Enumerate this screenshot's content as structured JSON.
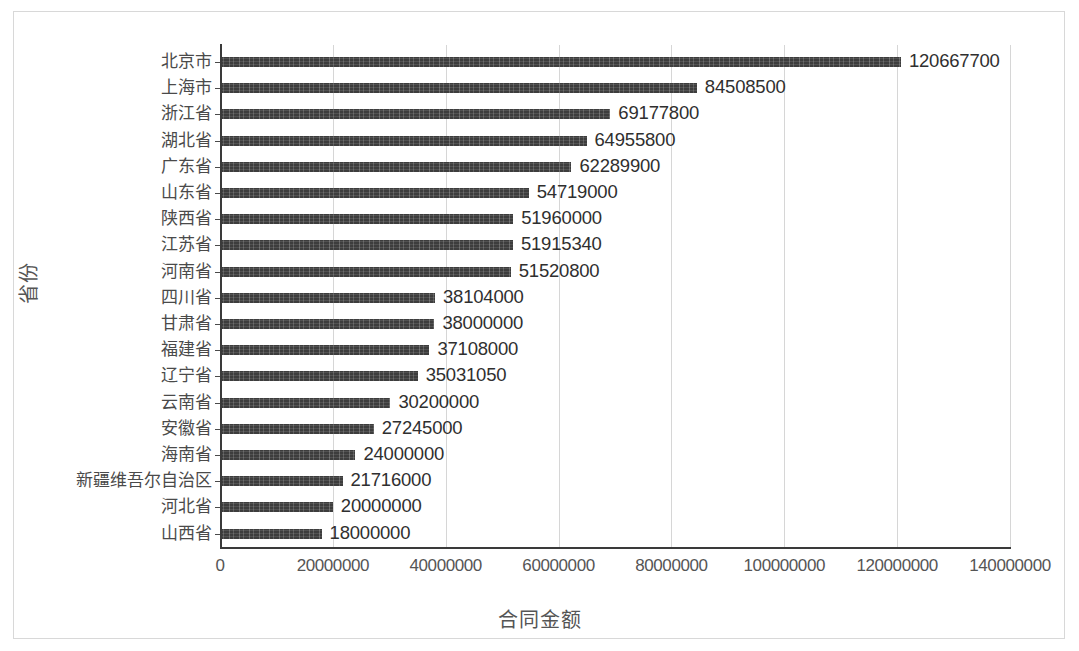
{
  "chart_data": {
    "type": "bar",
    "orientation": "horizontal",
    "title": "",
    "xlabel": "合同金额",
    "ylabel": "省份",
    "xlim": [
      0,
      140000000
    ],
    "ylim": null,
    "grid": true,
    "legend": false,
    "xticks": [
      "0",
      "20000000",
      "40000000",
      "60000000",
      "80000000",
      "100000000",
      "120000000",
      "140000000"
    ],
    "xtick_values": [
      0,
      20000000,
      40000000,
      60000000,
      80000000,
      100000000,
      120000000,
      140000000
    ],
    "categories": [
      "北京市",
      "上海市",
      "浙江省",
      "湖北省",
      "广东省",
      "山东省",
      "陕西省",
      "江苏省",
      "河南省",
      "四川省",
      "甘肃省",
      "福建省",
      "辽宁省",
      "云南省",
      "安徽省",
      "海南省",
      "新疆维吾尔自治区",
      "河北省",
      "山西省"
    ],
    "values": [
      120667700,
      84508500,
      69177800,
      64955800,
      62289900,
      54719000,
      51960000,
      51915340,
      51520800,
      38104000,
      38000000,
      37108000,
      35031050,
      30200000,
      27245000,
      24000000,
      21716000,
      20000000,
      18000000
    ],
    "data_labels": [
      "120667700",
      "84508500",
      "69177800",
      "64955800",
      "62289900",
      "54719000",
      "51960000",
      "51915340",
      "51520800",
      "38104000",
      "38000000",
      "37108000",
      "35031050",
      "30200000",
      "27245000",
      "24000000",
      "21716000",
      "20000000",
      "18000000"
    ],
    "colors": {
      "bar": "#3d3d3d",
      "gridline": "#d6d6d6",
      "axis": "#3a3a3a",
      "label_text": "#2f2f2f",
      "tick_text": "#555555",
      "frame": "#d8d8d8",
      "background": "#ffffff"
    }
  }
}
